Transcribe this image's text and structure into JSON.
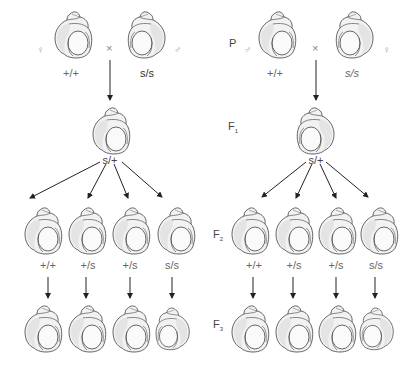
{
  "generation_labels": {
    "p": "P",
    "f1": "F",
    "f1_sub": "1",
    "f2": "F",
    "f2_sub": "2",
    "f3": "F",
    "f3_sub": "3"
  },
  "cross_symbol": "×",
  "left_panel": {
    "parents": [
      {
        "sex": "♀",
        "genotype": "+/+",
        "coiling": "dextral"
      },
      {
        "sex": "♂",
        "genotype": "s/s",
        "coiling": "sinistral"
      }
    ],
    "f1": {
      "genotype": "s/+",
      "coiling": "dextral"
    },
    "f2": [
      {
        "genotype": "+/+",
        "coiling": "dextral"
      },
      {
        "genotype": "+/s",
        "coiling": "dextral"
      },
      {
        "genotype": "+/s",
        "coiling": "dextral"
      },
      {
        "genotype": "s/s",
        "coiling": "dextral"
      }
    ],
    "f3": [
      {
        "coiling": "dextral"
      },
      {
        "coiling": "dextral"
      },
      {
        "coiling": "dextral"
      },
      {
        "coiling": "sinistral"
      }
    ]
  },
  "right_panel": {
    "parents": [
      {
        "sex": "♂",
        "genotype": "+/+",
        "coiling": "dextral"
      },
      {
        "sex": "♀",
        "genotype": "s/s",
        "coiling": "sinistral"
      }
    ],
    "f1": {
      "genotype": "s/+",
      "coiling": "sinistral"
    },
    "f2": [
      {
        "genotype": "+/+",
        "coiling": "dextral"
      },
      {
        "genotype": "+/s",
        "coiling": "dextral"
      },
      {
        "genotype": "+/s",
        "coiling": "dextral"
      },
      {
        "genotype": "s/s",
        "coiling": "dextral"
      }
    ],
    "f3": [
      {
        "coiling": "dextral"
      },
      {
        "coiling": "dextral"
      },
      {
        "coiling": "dextral"
      },
      {
        "coiling": "sinistral"
      }
    ]
  },
  "colors": {
    "line": "#222222",
    "shell_stroke": "#555555",
    "shell_fill": "#f2f2f2",
    "shell_shade": "#e2e2e2"
  }
}
